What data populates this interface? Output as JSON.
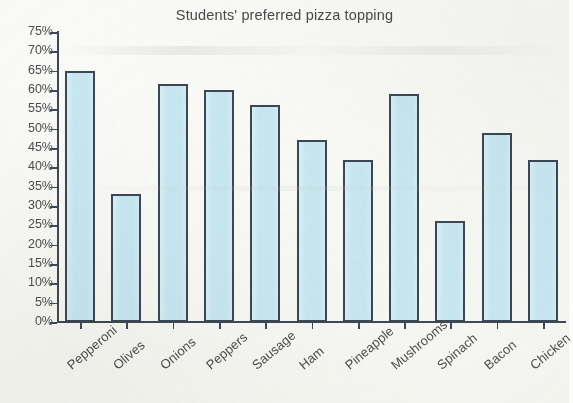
{
  "chart_data": {
    "type": "bar",
    "title": "Students' preferred pizza topping",
    "xlabel": "",
    "ylabel": "",
    "ylim": [
      0,
      75
    ],
    "ytick_step": 5,
    "ytick_labels": [
      "75%",
      "70%",
      "65%",
      "60%",
      "55%",
      "50%",
      "45%",
      "40%",
      "35%",
      "30%",
      "25%",
      "20%",
      "15%",
      "10%",
      "5%",
      "0%"
    ],
    "ytick_values": [
      75,
      70,
      65,
      60,
      55,
      50,
      45,
      40,
      35,
      30,
      25,
      20,
      15,
      10,
      5,
      0
    ],
    "grid": false,
    "legend": null,
    "value_suffix": "%",
    "categories": [
      "Pepperoni",
      "Olives",
      "Onions",
      "Peppers",
      "Sausage",
      "Ham",
      "Pineapple",
      "Mushrooms",
      "Spinach",
      "Bacon",
      "Chicken"
    ],
    "values": [
      65,
      33,
      61.5,
      60,
      56,
      47,
      42,
      59,
      26,
      49,
      42
    ],
    "bar_fill_color": "#c9e9f4",
    "bar_border_color": "#3c4856",
    "axis_color": "#3f4a57",
    "text_color": "#4d4d4f",
    "background_color": "#fdfdfb"
  }
}
